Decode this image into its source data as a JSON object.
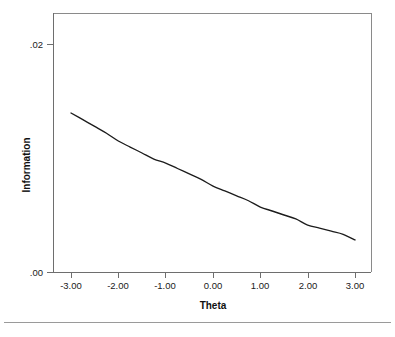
{
  "chart_data": {
    "type": "line",
    "title": "",
    "xlabel": "Theta",
    "ylabel": "Information",
    "xlim": [
      -3.5,
      3.5
    ],
    "ylim": [
      0.0,
      0.02
    ],
    "xticks": [
      -3,
      -2,
      -1,
      0,
      1,
      2,
      3
    ],
    "xticklabels": [
      "-3.00",
      "-2.00",
      "-1.00",
      "0.00",
      "1.00",
      "2.00",
      "3.00"
    ],
    "yticks": [
      0.0,
      0.02
    ],
    "yticklabels": [
      ".00",
      ".02"
    ],
    "grid": false,
    "legend": null,
    "series": [
      {
        "name": "Information",
        "color": "#1c1c1c",
        "x": [
          -3.0,
          -2.75,
          -2.5,
          -2.25,
          -2.0,
          -1.75,
          -1.5,
          -1.25,
          -1.0,
          -0.75,
          -0.5,
          -0.25,
          0.0,
          0.25,
          0.5,
          0.75,
          1.0,
          1.25,
          1.5,
          1.75,
          2.0,
          2.25,
          2.5,
          2.75,
          3.0
        ],
        "y": [
          0.01395,
          0.01336,
          0.01277,
          0.01217,
          0.01149,
          0.01096,
          0.01044,
          0.00991,
          0.00956,
          0.00908,
          0.0086,
          0.00812,
          0.00754,
          0.00711,
          0.00668,
          0.00625,
          0.0057,
          0.00535,
          0.005,
          0.00465,
          0.00412,
          0.00385,
          0.00358,
          0.00331,
          0.00281
        ]
      }
    ]
  },
  "axes": {
    "x_axis_title": "Theta",
    "y_axis_title": "Information",
    "x_tick_labels": [
      "-3.00",
      "-2.00",
      "-1.00",
      "0.00",
      "1.00",
      "2.00",
      "3.00"
    ],
    "y_tick_labels": [
      ".02",
      ".00"
    ]
  },
  "colors": {
    "curve": "#1c1c1c",
    "axis": "#6e6e6e",
    "frame": "#8a8a8a",
    "background": "#ffffff",
    "text": "#1a1a1a",
    "footer_rule": "#9a9a9a"
  }
}
